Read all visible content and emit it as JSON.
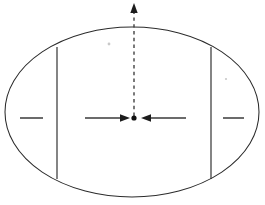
{
  "figure": {
    "canvas": {
      "width": 265,
      "height": 205,
      "background": "#ffffff"
    },
    "stroke_color": "#2b2b2b",
    "arrow_color": "#3a3a3a",
    "point_color": "#111111"
  },
  "ellipse": {
    "name": "outer-ellipse",
    "center_x": 132,
    "center_y": 112,
    "radius_x": 127,
    "radius_y": 85,
    "stroke_width": 1.05
  },
  "chords": [
    {
      "name": "left-vertical-chord",
      "x": 57,
      "y_top": 47,
      "y_bottom": 179
    },
    {
      "name": "right-vertical-chord",
      "x": 211,
      "y_top": 47,
      "y_bottom": 179
    }
  ],
  "center_point": {
    "name": "center-dot",
    "x": 134,
    "y": 118,
    "radius": 2.6
  },
  "arrows": [
    {
      "name": "left-inward-arrow",
      "direction": "right",
      "tail_x": 85,
      "tip_x": 130,
      "y": 118
    },
    {
      "name": "right-inward-arrow",
      "direction": "left",
      "tail_x": 186,
      "tip_x": 141,
      "y": 118
    }
  ],
  "vertical_axis": {
    "name": "vertical-dashed-arrow",
    "x": 134,
    "tail_y": 116,
    "tip_y": 3,
    "style": "dashed",
    "dash_pattern": "3.4 3.4",
    "direction": "up"
  },
  "side_dashes": [
    {
      "name": "left-side-dash",
      "x_start": 20,
      "x_end": 43,
      "y": 118
    },
    {
      "name": "right-side-dash",
      "x_start": 223,
      "x_end": 244,
      "y": 118
    }
  ],
  "specks": [
    {
      "name": "speck-upper-left",
      "x": 109,
      "y": 44,
      "r": 1.4
    },
    {
      "name": "speck-mid-right",
      "x": 226,
      "y": 79,
      "r": 1.1
    }
  ],
  "labels": {
    "none_visible": ""
  }
}
